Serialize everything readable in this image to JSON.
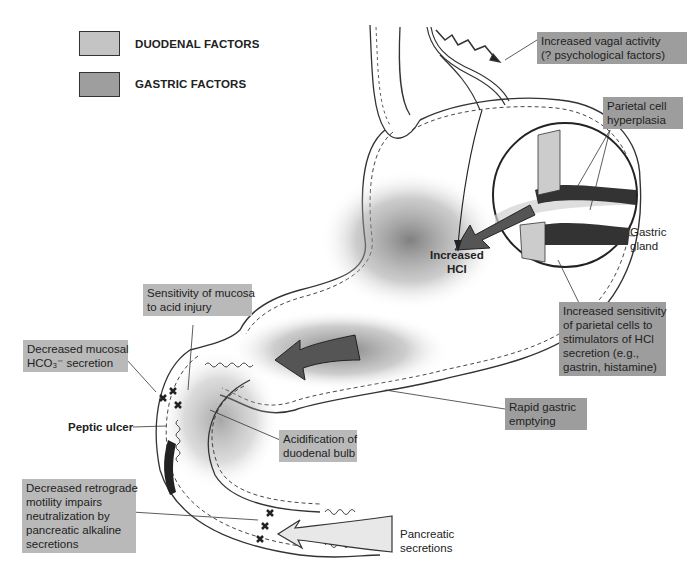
{
  "legend": {
    "items": [
      {
        "label": "DUODENAL FACTORS",
        "color": "#c4c4c4"
      },
      {
        "label": "GASTRIC FACTORS",
        "color": "#9e9e9e"
      }
    ]
  },
  "labels": {
    "vagal": [
      "Increased vagal activity",
      "(? psychological factors)"
    ],
    "parietal_hyperplasia": [
      "Parietal cell",
      "hyperplasia"
    ],
    "gastric_gland": [
      "Gastric",
      "gland"
    ],
    "increased_hcl": [
      "Increased",
      "HCl"
    ],
    "sensitivity_parietal": [
      "Increased sensitivity",
      "of parietal cells to",
      "stimulators of HCl",
      "secretion (e.g.,",
      "gastrin, histamine)"
    ],
    "sensitivity_mucosa": [
      "Sensitivity of mucosa",
      "to acid injury"
    ],
    "decreased_hco3": [
      "Decreased mucosal",
      "HCO₃⁻ secretion"
    ],
    "rapid_emptying": [
      "Rapid gastric",
      "emptying"
    ],
    "peptic_ulcer": "Peptic ulcer",
    "acidification": [
      "Acidification of",
      "duodenal bulb"
    ],
    "retrograde": [
      "Decreased retrograde",
      "motility impairs",
      "neutralization by",
      "pancreatic alkaline",
      "secretions"
    ],
    "pancreatic": [
      "Pancreatic",
      "secretions"
    ]
  },
  "colors": {
    "duodenal_box": "#b9b9b9",
    "gastric_box": "#9d9d9d",
    "outline": "#222222"
  }
}
